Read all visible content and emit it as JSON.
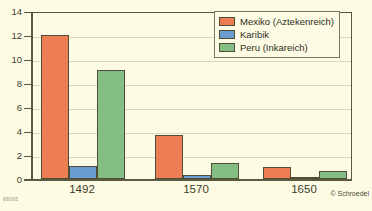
{
  "chart_data": {
    "type": "bar",
    "title": "",
    "subtitle": "",
    "xlabel": "",
    "ylabel": "",
    "categories": [
      "1492",
      "1570",
      "1650"
    ],
    "series": [
      {
        "name": "Mexiko (Aztekenreich)",
        "color": "#ed7d52",
        "values": [
          12.0,
          3.7,
          1.0
        ]
      },
      {
        "name": "Karibik",
        "color": "#6a9bd1",
        "values": [
          1.05,
          0.35,
          0.12
        ]
      },
      {
        "name": "Peru (Inkareich)",
        "color": "#84be83",
        "values": [
          9.05,
          1.35,
          0.7
        ]
      }
    ],
    "ylim": [
      0,
      14
    ],
    "yticks": [
      0,
      2,
      4,
      6,
      8,
      10,
      12,
      14
    ],
    "ytick_labels": [
      "0",
      "2",
      "4",
      "6",
      "8",
      "10",
      "12",
      "14"
    ],
    "grid": true,
    "grid_axis": "y",
    "legend_position": "top-right",
    "background_color": "#fdfbe4",
    "axis_color": "#5c5a3e",
    "grid_color": "#dcd8b4"
  },
  "legend": {
    "entries": [
      {
        "label": "Mexiko (Aztekenreich)",
        "color": "#ed7d52"
      },
      {
        "label": "Karibik",
        "color": "#6a9bd1"
      },
      {
        "label": "Peru (Inkareich)",
        "color": "#84be83"
      }
    ]
  },
  "credit": "© Schroedel",
  "source_mark": "89095"
}
